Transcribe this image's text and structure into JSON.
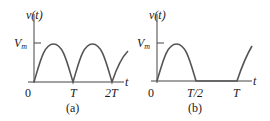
{
  "figure": {
    "panels": [
      {
        "id": "a",
        "caption": "(a)",
        "title": "Full-wave rectified sine",
        "y_label": "v(t)",
        "x_label": "t",
        "amplitude_label": "V",
        "amplitude_sub": "m",
        "x_ticks": [
          "0",
          "T",
          "2T"
        ]
      },
      {
        "id": "b",
        "caption": "(b)",
        "title": "Half-wave rectified sine",
        "y_label": "v(t)",
        "x_label": "t",
        "amplitude_label": "V",
        "amplitude_sub": "m",
        "x_ticks": [
          "0",
          "T/2",
          "T"
        ]
      }
    ],
    "colors": {
      "curve": "#555555",
      "axis": "#444444",
      "text": "#1a1a1a"
    }
  }
}
